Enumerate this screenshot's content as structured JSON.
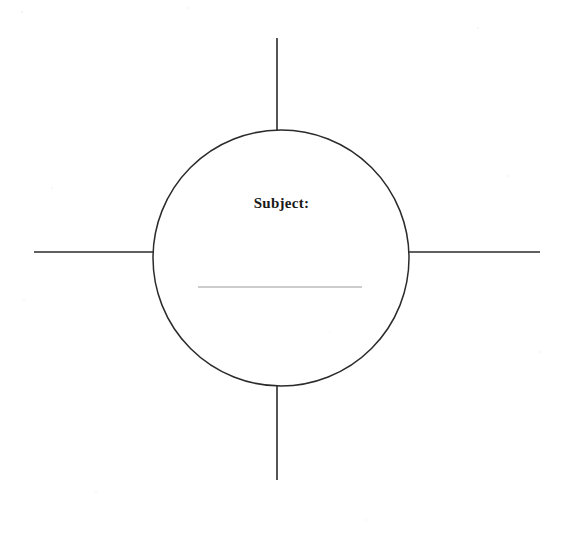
{
  "page": {
    "background_color": "#ffffff",
    "width": 570,
    "height": 542
  },
  "organizer": {
    "type": "circle-web-diagram",
    "center_node": {
      "shape": "circle",
      "label": "Subject:",
      "label_color": "#1a1a1a",
      "stroke_color": "#2b2b2b",
      "stroke_width": 1.4,
      "fill": "#ffffff",
      "center_x": 281,
      "center_y": 258,
      "radius": 128,
      "write_in_line": {
        "value": "",
        "placeholder": "",
        "color": "#9a9a9a",
        "x1": 198,
        "x2": 362,
        "y": 287
      }
    },
    "branches": [
      {
        "name": "top-branch",
        "direction": "up",
        "label": "",
        "color": "#2b2b2b",
        "x1": 277,
        "y1": 38,
        "x2": 277,
        "y2": 131
      },
      {
        "name": "right-branch",
        "direction": "right",
        "label": "",
        "color": "#2b2b2b",
        "x1": 409,
        "y1": 252,
        "x2": 540,
        "y2": 252
      },
      {
        "name": "bottom-branch",
        "direction": "down",
        "label": "",
        "color": "#2b2b2b",
        "x1": 277,
        "y1": 386,
        "x2": 277,
        "y2": 480
      },
      {
        "name": "left-branch",
        "direction": "left",
        "label": "",
        "color": "#2b2b2b",
        "x1": 34,
        "y1": 252,
        "x2": 155,
        "y2": 252
      }
    ]
  }
}
